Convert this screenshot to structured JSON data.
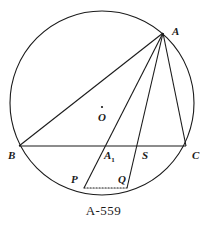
{
  "figure": {
    "caption": "A-559",
    "stroke_color": "#1a1a1a",
    "background_color": "#ffffff",
    "circle": {
      "center_x": 102,
      "center_y": 103,
      "radius": 92,
      "center_marker_label": "O"
    },
    "points": [
      {
        "id": "A",
        "label": "A",
        "x": 163,
        "y": 33,
        "label_x": 172,
        "label_y": 26
      },
      {
        "id": "B",
        "label": "B",
        "x": 19,
        "y": 146,
        "label_x": 8,
        "label_y": 150
      },
      {
        "id": "C",
        "label": "C",
        "x": 186,
        "y": 146,
        "label_x": 192,
        "label_y": 150
      },
      {
        "id": "A1",
        "label": "A",
        "sub": "1",
        "x": 103,
        "y": 146,
        "label_x": 104,
        "label_y": 150
      },
      {
        "id": "S",
        "label": "S",
        "x": 137,
        "y": 146,
        "label_x": 142,
        "label_y": 150
      },
      {
        "id": "P",
        "label": "P",
        "x": 84,
        "y": 188,
        "label_x": 71,
        "label_y": 174
      },
      {
        "id": "Q",
        "label": "Q",
        "x": 127,
        "y": 188,
        "label_x": 118,
        "label_y": 174
      },
      {
        "id": "O",
        "label": "O",
        "x": 102,
        "y": 107,
        "label_x": 98,
        "label_y": 112
      }
    ],
    "segments": [
      {
        "name": "chord-BC",
        "from": "B",
        "to": "C",
        "style": "solid"
      },
      {
        "name": "chord-AB",
        "from": "A",
        "to": "B",
        "style": "solid"
      },
      {
        "name": "chord-AC",
        "from": "A",
        "to": "C",
        "style": "solid"
      },
      {
        "name": "cevian-A-to-P",
        "from": "A",
        "to": "P",
        "style": "solid"
      },
      {
        "name": "cevian-A-to-Q",
        "from": "A",
        "to": "Q",
        "style": "solid"
      },
      {
        "name": "chord-PQ",
        "from": "P",
        "to": "Q",
        "style": "dotted"
      }
    ]
  }
}
